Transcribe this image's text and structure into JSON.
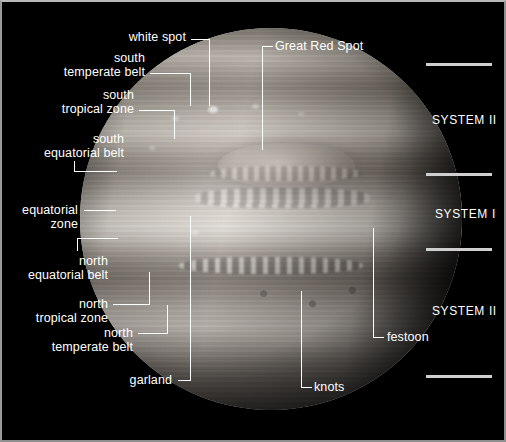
{
  "figure": {
    "background_color": "#000000",
    "label_color": "#ffffff",
    "rule_color": "#cfcfcf"
  },
  "labels": {
    "white_spot": "white spot",
    "great_red_spot": "Great Red Spot",
    "south_temperate_belt_line1": "south",
    "south_temperate_belt_line2": "temperate belt",
    "south_tropical_zone_line1": "south",
    "south_tropical_zone_line2": "tropical zone",
    "south_equatorial_belt_line1": "south",
    "south_equatorial_belt_line2": "equatorial belt",
    "equatorial_zone_line1": "equatorial",
    "equatorial_zone_line2": "zone",
    "north_equatorial_belt_line1": "north",
    "north_equatorial_belt_line2": "equatorial belt",
    "north_tropical_zone_line1": "north",
    "north_tropical_zone_line2": "tropical zone",
    "north_temperate_belt_line1": "north",
    "north_temperate_belt_line2": "temperate belt",
    "garland": "garland",
    "knots": "knots",
    "festoon": "festoon"
  },
  "systems": {
    "top": "SYSTEM II",
    "middle": "SYSTEM I",
    "bottom": "SYSTEM II"
  }
}
